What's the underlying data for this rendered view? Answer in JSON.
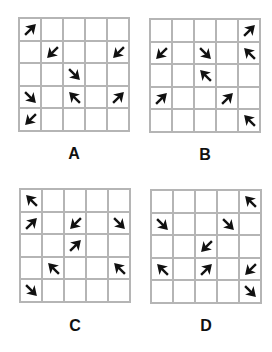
{
  "puzzle": {
    "options": [
      {
        "label": "A",
        "arrows": [
          {
            "row": 0,
            "col": 0,
            "dir": "NE"
          },
          {
            "row": 1,
            "col": 1,
            "dir": "SW"
          },
          {
            "row": 1,
            "col": 4,
            "dir": "SW"
          },
          {
            "row": 2,
            "col": 2,
            "dir": "SE"
          },
          {
            "row": 3,
            "col": 0,
            "dir": "SE"
          },
          {
            "row": 3,
            "col": 2,
            "dir": "NW"
          },
          {
            "row": 3,
            "col": 4,
            "dir": "NE"
          },
          {
            "row": 4,
            "col": 0,
            "dir": "SW"
          }
        ]
      },
      {
        "label": "B",
        "arrows": [
          {
            "row": 0,
            "col": 4,
            "dir": "NE"
          },
          {
            "row": 1,
            "col": 0,
            "dir": "SW"
          },
          {
            "row": 1,
            "col": 2,
            "dir": "SE"
          },
          {
            "row": 1,
            "col": 4,
            "dir": "NW"
          },
          {
            "row": 2,
            "col": 2,
            "dir": "NW"
          },
          {
            "row": 3,
            "col": 0,
            "dir": "NE"
          },
          {
            "row": 3,
            "col": 3,
            "dir": "NE"
          },
          {
            "row": 4,
            "col": 4,
            "dir": "NW"
          }
        ]
      },
      {
        "label": "C",
        "arrows": [
          {
            "row": 0,
            "col": 0,
            "dir": "NW"
          },
          {
            "row": 1,
            "col": 0,
            "dir": "NE"
          },
          {
            "row": 1,
            "col": 2,
            "dir": "SW"
          },
          {
            "row": 1,
            "col": 4,
            "dir": "SE"
          },
          {
            "row": 2,
            "col": 2,
            "dir": "NE"
          },
          {
            "row": 3,
            "col": 1,
            "dir": "NW"
          },
          {
            "row": 3,
            "col": 4,
            "dir": "NW"
          },
          {
            "row": 4,
            "col": 0,
            "dir": "SE"
          }
        ]
      },
      {
        "label": "D",
        "arrows": [
          {
            "row": 0,
            "col": 4,
            "dir": "NW"
          },
          {
            "row": 1,
            "col": 0,
            "dir": "SE"
          },
          {
            "row": 1,
            "col": 3,
            "dir": "SE"
          },
          {
            "row": 2,
            "col": 2,
            "dir": "SW"
          },
          {
            "row": 3,
            "col": 0,
            "dir": "NW"
          },
          {
            "row": 3,
            "col": 2,
            "dir": "NE"
          },
          {
            "row": 3,
            "col": 4,
            "dir": "SW"
          },
          {
            "row": 4,
            "col": 4,
            "dir": "SE"
          }
        ]
      }
    ],
    "grid_size": 5,
    "colors": {
      "grid_line": "#b5b5b5",
      "arrow": "#111111",
      "label": "#111111"
    }
  }
}
